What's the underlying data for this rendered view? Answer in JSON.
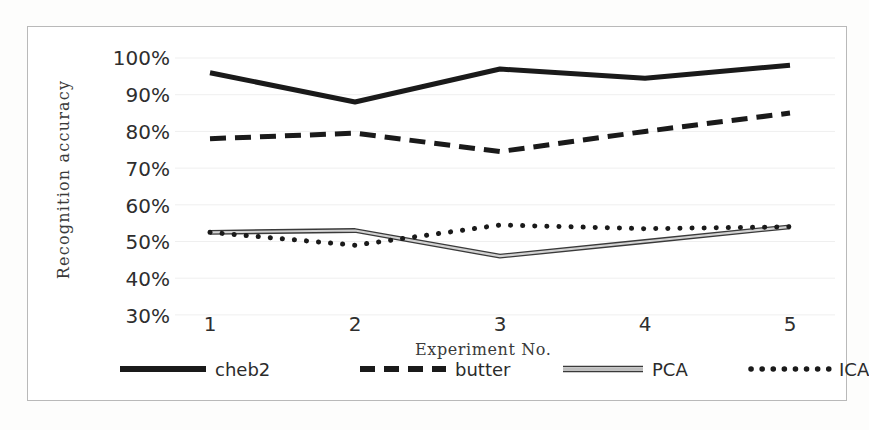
{
  "chart_data": {
    "type": "line",
    "title": "",
    "xlabel": "Experiment No.",
    "ylabel": "Recognition accuracy",
    "x": [
      1,
      2,
      3,
      4,
      5
    ],
    "xtick_labels": [
      "1",
      "2",
      "3",
      "4",
      "5"
    ],
    "ytick_labels": [
      "100%",
      "90%",
      "80%",
      "70%",
      "60%",
      "50%",
      "40%",
      "30%"
    ],
    "ytick_values": [
      100,
      90,
      80,
      70,
      60,
      50,
      40,
      30
    ],
    "ylim": [
      30,
      103
    ],
    "xlim": [
      0.7,
      5.3
    ],
    "grid": "horizontal-faint",
    "legend_position": "bottom",
    "series": [
      {
        "name": "cheb2",
        "style": "solid",
        "color": "#1a1a1a",
        "width": 5,
        "values": [
          96.0,
          88.0,
          97.0,
          94.5,
          98.0
        ]
      },
      {
        "name": "butter",
        "style": "dashed",
        "color": "#1a1a1a",
        "width": 5,
        "values": [
          78.0,
          79.5,
          74.5,
          80.0,
          85.0
        ]
      },
      {
        "name": "PCA",
        "style": "double-outline",
        "color": "#555555",
        "width": 3,
        "values": [
          52.5,
          53.0,
          46.0,
          50.0,
          54.0
        ]
      },
      {
        "name": "ICA",
        "style": "dotted",
        "color": "#1a1a1a",
        "width": 5,
        "values": [
          52.5,
          49.0,
          54.5,
          53.5,
          54.0
        ]
      }
    ]
  },
  "legend": {
    "items": [
      {
        "label": "cheb2",
        "style": "solid"
      },
      {
        "label": "butter",
        "style": "dashed"
      },
      {
        "label": "PCA",
        "style": "double-outline"
      },
      {
        "label": "ICA",
        "style": "dotted"
      }
    ]
  },
  "colors": {
    "background": "#ffffff",
    "frame": "#b9b9b9",
    "text": "#2b2b2b",
    "series_dark": "#1a1a1a",
    "series_gray": "#555555"
  }
}
